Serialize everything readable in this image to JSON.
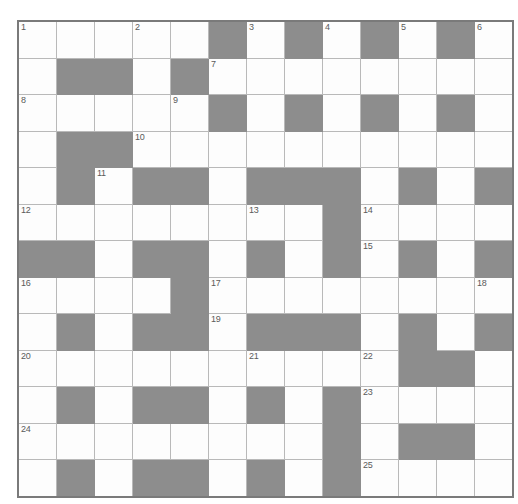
{
  "puzzle": {
    "title": "Crossword Grid",
    "rows": 13,
    "columns": 13,
    "cell_size_px": 37,
    "colors": {
      "block_fill": "#8d8d8d",
      "open_fill": "#fdfdfd",
      "grid_line": "#b9b9b9",
      "outer_border": "#7a7a7a",
      "number_text": "#5a5a5a"
    },
    "clue_numbers_present": [
      1,
      2,
      3,
      4,
      5,
      6,
      7,
      8,
      9,
      10,
      11,
      12,
      13,
      14,
      15,
      16,
      17,
      18,
      19,
      20,
      21,
      22,
      23,
      24,
      25
    ],
    "legend": {
      "open_cell": "white fillable square",
      "blocked_cell": "grey solid block"
    },
    "grid": [
      [
        {
          "type": "open",
          "number": "1"
        },
        {
          "type": "open",
          "number": ""
        },
        {
          "type": "open",
          "number": ""
        },
        {
          "type": "open",
          "number": "2"
        },
        {
          "type": "open",
          "number": ""
        },
        {
          "type": "block",
          "number": ""
        },
        {
          "type": "open",
          "number": "3"
        },
        {
          "type": "block",
          "number": ""
        },
        {
          "type": "open",
          "number": "4"
        },
        {
          "type": "block",
          "number": ""
        },
        {
          "type": "open",
          "number": "5"
        },
        {
          "type": "block",
          "number": ""
        },
        {
          "type": "open",
          "number": "6"
        }
      ],
      [
        {
          "type": "open",
          "number": ""
        },
        {
          "type": "block",
          "number": ""
        },
        {
          "type": "block",
          "number": ""
        },
        {
          "type": "open",
          "number": ""
        },
        {
          "type": "block",
          "number": ""
        },
        {
          "type": "open",
          "number": "7"
        },
        {
          "type": "open",
          "number": ""
        },
        {
          "type": "open",
          "number": ""
        },
        {
          "type": "open",
          "number": ""
        },
        {
          "type": "open",
          "number": ""
        },
        {
          "type": "open",
          "number": ""
        },
        {
          "type": "open",
          "number": ""
        },
        {
          "type": "open",
          "number": ""
        }
      ],
      [
        {
          "type": "open",
          "number": "8"
        },
        {
          "type": "open",
          "number": ""
        },
        {
          "type": "open",
          "number": ""
        },
        {
          "type": "open",
          "number": ""
        },
        {
          "type": "open",
          "number": "9"
        },
        {
          "type": "block",
          "number": ""
        },
        {
          "type": "open",
          "number": ""
        },
        {
          "type": "block",
          "number": ""
        },
        {
          "type": "open",
          "number": ""
        },
        {
          "type": "block",
          "number": ""
        },
        {
          "type": "open",
          "number": ""
        },
        {
          "type": "block",
          "number": ""
        },
        {
          "type": "open",
          "number": ""
        }
      ],
      [
        {
          "type": "open",
          "number": ""
        },
        {
          "type": "block",
          "number": ""
        },
        {
          "type": "block",
          "number": ""
        },
        {
          "type": "open",
          "number": "10"
        },
        {
          "type": "open",
          "number": ""
        },
        {
          "type": "open",
          "number": ""
        },
        {
          "type": "open",
          "number": ""
        },
        {
          "type": "open",
          "number": ""
        },
        {
          "type": "open",
          "number": ""
        },
        {
          "type": "open",
          "number": ""
        },
        {
          "type": "open",
          "number": ""
        },
        {
          "type": "open",
          "number": ""
        },
        {
          "type": "open",
          "number": ""
        }
      ],
      [
        {
          "type": "open",
          "number": ""
        },
        {
          "type": "block",
          "number": ""
        },
        {
          "type": "open",
          "number": "11"
        },
        {
          "type": "block",
          "number": ""
        },
        {
          "type": "block",
          "number": ""
        },
        {
          "type": "open",
          "number": ""
        },
        {
          "type": "block",
          "number": ""
        },
        {
          "type": "block",
          "number": ""
        },
        {
          "type": "block",
          "number": ""
        },
        {
          "type": "open",
          "number": ""
        },
        {
          "type": "block",
          "number": ""
        },
        {
          "type": "open",
          "number": ""
        },
        {
          "type": "block",
          "number": ""
        }
      ],
      [
        {
          "type": "open",
          "number": "12"
        },
        {
          "type": "open",
          "number": ""
        },
        {
          "type": "open",
          "number": ""
        },
        {
          "type": "open",
          "number": ""
        },
        {
          "type": "open",
          "number": ""
        },
        {
          "type": "open",
          "number": ""
        },
        {
          "type": "open",
          "number": "13"
        },
        {
          "type": "open",
          "number": ""
        },
        {
          "type": "block",
          "number": ""
        },
        {
          "type": "open",
          "number": "14"
        },
        {
          "type": "open",
          "number": ""
        },
        {
          "type": "open",
          "number": ""
        },
        {
          "type": "open",
          "number": ""
        }
      ],
      [
        {
          "type": "block",
          "number": ""
        },
        {
          "type": "block",
          "number": ""
        },
        {
          "type": "open",
          "number": ""
        },
        {
          "type": "block",
          "number": ""
        },
        {
          "type": "block",
          "number": ""
        },
        {
          "type": "open",
          "number": ""
        },
        {
          "type": "block",
          "number": ""
        },
        {
          "type": "open",
          "number": ""
        },
        {
          "type": "block",
          "number": ""
        },
        {
          "type": "open",
          "number": "15"
        },
        {
          "type": "block",
          "number": ""
        },
        {
          "type": "open",
          "number": ""
        },
        {
          "type": "block",
          "number": ""
        }
      ],
      [
        {
          "type": "open",
          "number": "16"
        },
        {
          "type": "open",
          "number": ""
        },
        {
          "type": "open",
          "number": ""
        },
        {
          "type": "open",
          "number": ""
        },
        {
          "type": "block",
          "number": ""
        },
        {
          "type": "open",
          "number": "17"
        },
        {
          "type": "open",
          "number": ""
        },
        {
          "type": "open",
          "number": ""
        },
        {
          "type": "open",
          "number": ""
        },
        {
          "type": "open",
          "number": ""
        },
        {
          "type": "open",
          "number": ""
        },
        {
          "type": "open",
          "number": ""
        },
        {
          "type": "open",
          "number": "18"
        }
      ],
      [
        {
          "type": "open",
          "number": ""
        },
        {
          "type": "block",
          "number": ""
        },
        {
          "type": "open",
          "number": ""
        },
        {
          "type": "block",
          "number": ""
        },
        {
          "type": "block",
          "number": ""
        },
        {
          "type": "open",
          "number": "19"
        },
        {
          "type": "block",
          "number": ""
        },
        {
          "type": "block",
          "number": ""
        },
        {
          "type": "block",
          "number": ""
        },
        {
          "type": "open",
          "number": ""
        },
        {
          "type": "block",
          "number": ""
        },
        {
          "type": "open",
          "number": ""
        },
        {
          "type": "block",
          "number": ""
        }
      ],
      [
        {
          "type": "open",
          "number": "20"
        },
        {
          "type": "open",
          "number": ""
        },
        {
          "type": "open",
          "number": ""
        },
        {
          "type": "open",
          "number": ""
        },
        {
          "type": "open",
          "number": ""
        },
        {
          "type": "open",
          "number": ""
        },
        {
          "type": "open",
          "number": "21"
        },
        {
          "type": "open",
          "number": ""
        },
        {
          "type": "open",
          "number": ""
        },
        {
          "type": "open",
          "number": "22"
        },
        {
          "type": "block",
          "number": ""
        },
        {
          "type": "block",
          "number": ""
        },
        {
          "type": "open",
          "number": ""
        }
      ],
      [
        {
          "type": "open",
          "number": ""
        },
        {
          "type": "block",
          "number": ""
        },
        {
          "type": "open",
          "number": ""
        },
        {
          "type": "block",
          "number": ""
        },
        {
          "type": "block",
          "number": ""
        },
        {
          "type": "open",
          "number": ""
        },
        {
          "type": "block",
          "number": ""
        },
        {
          "type": "open",
          "number": ""
        },
        {
          "type": "block",
          "number": ""
        },
        {
          "type": "open",
          "number": "23"
        },
        {
          "type": "open",
          "number": ""
        },
        {
          "type": "open",
          "number": ""
        },
        {
          "type": "open",
          "number": ""
        }
      ],
      [
        {
          "type": "open",
          "number": "24"
        },
        {
          "type": "open",
          "number": ""
        },
        {
          "type": "open",
          "number": ""
        },
        {
          "type": "open",
          "number": ""
        },
        {
          "type": "open",
          "number": ""
        },
        {
          "type": "open",
          "number": ""
        },
        {
          "type": "open",
          "number": ""
        },
        {
          "type": "open",
          "number": ""
        },
        {
          "type": "block",
          "number": ""
        },
        {
          "type": "open",
          "number": ""
        },
        {
          "type": "block",
          "number": ""
        },
        {
          "type": "block",
          "number": ""
        },
        {
          "type": "open",
          "number": ""
        }
      ],
      [
        {
          "type": "open",
          "number": ""
        },
        {
          "type": "block",
          "number": ""
        },
        {
          "type": "open",
          "number": ""
        },
        {
          "type": "block",
          "number": ""
        },
        {
          "type": "block",
          "number": ""
        },
        {
          "type": "open",
          "number": ""
        },
        {
          "type": "block",
          "number": ""
        },
        {
          "type": "open",
          "number": ""
        },
        {
          "type": "block",
          "number": ""
        },
        {
          "type": "open",
          "number": "25"
        },
        {
          "type": "open",
          "number": ""
        },
        {
          "type": "open",
          "number": ""
        },
        {
          "type": "open",
          "number": ""
        }
      ]
    ]
  }
}
